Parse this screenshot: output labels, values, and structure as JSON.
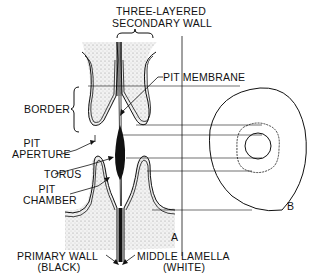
{
  "diagram": {
    "title_lines": [
      "THREE-LAYERED",
      "SECONDARY WALL"
    ],
    "labels": {
      "pit_membrane": "PIT MEMBRANE",
      "border": "BORDER",
      "pit_aperture_1": "PIT",
      "pit_aperture_2": "APERTURE",
      "torus": "TORUS",
      "pit_chamber_1": "PIT",
      "pit_chamber_2": "CHAMBER",
      "primary_wall_1": "PRIMARY WALL",
      "primary_wall_2": "(BLACK)",
      "middle_lamella_1": "MIDDLE LAMELLA",
      "middle_lamella_2": "(WHITE)",
      "view_a": "A",
      "view_b": "B"
    },
    "colors": {
      "ink": "#111111",
      "stipple": "#bbbbbb",
      "background": "#ffffff"
    }
  }
}
